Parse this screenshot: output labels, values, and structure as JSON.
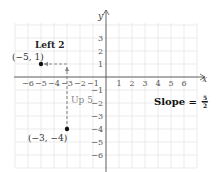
{
  "chart_data": {
    "type": "scatter",
    "title": "",
    "xlabel": "x",
    "ylabel": "y",
    "xlim": [
      -7,
      7
    ],
    "ylim": [
      -7,
      4
    ],
    "grid": true,
    "x_ticks": [
      -6,
      -5,
      -4,
      -3,
      -2,
      -1,
      1,
      2,
      3,
      4,
      5,
      6
    ],
    "y_ticks": [
      3,
      2,
      1,
      -1,
      -2,
      -3,
      -4,
      -5,
      -6
    ],
    "x_tick_labels": [
      "−6",
      "−5",
      "−4",
      "−3",
      "−2",
      "−1",
      "1",
      "2",
      "3",
      "4",
      "5",
      "6"
    ],
    "y_tick_labels": [
      "3",
      "2",
      "1",
      "−1",
      "−2",
      "−3",
      "−4",
      "−5",
      "−6"
    ],
    "points": [
      {
        "x": -5,
        "y": 1,
        "label": "(−5, 1)"
      },
      {
        "x": -3,
        "y": -4,
        "label": "(−3, −4)"
      }
    ],
    "path": [
      {
        "from": [
          -3,
          -4
        ],
        "to": [
          -3,
          1
        ],
        "style": "dashed",
        "arrow": true,
        "label": "Up 5"
      },
      {
        "from": [
          -3,
          1
        ],
        "to": [
          -5,
          1
        ],
        "style": "dashed",
        "arrow": true,
        "label": "Left 2"
      }
    ],
    "annotations": [
      {
        "text": "Left 2",
        "style": "bold"
      },
      {
        "text": "Up 5",
        "style": "gray"
      },
      {
        "text": "Slope = −5/2",
        "style": "bold"
      }
    ]
  },
  "labels": {
    "x_axis": "x",
    "y_axis": "y",
    "point_a": "(−5, 1)",
    "point_b": "(−3, −4)",
    "left": "Left 2",
    "up": "Up 5",
    "slope_prefix": "Slope = −",
    "slope_num": "5",
    "slope_den": "2"
  },
  "colors": {
    "grid": "#e6e6e6",
    "axis": "#555555",
    "path": "#888888",
    "point": "#111111"
  }
}
